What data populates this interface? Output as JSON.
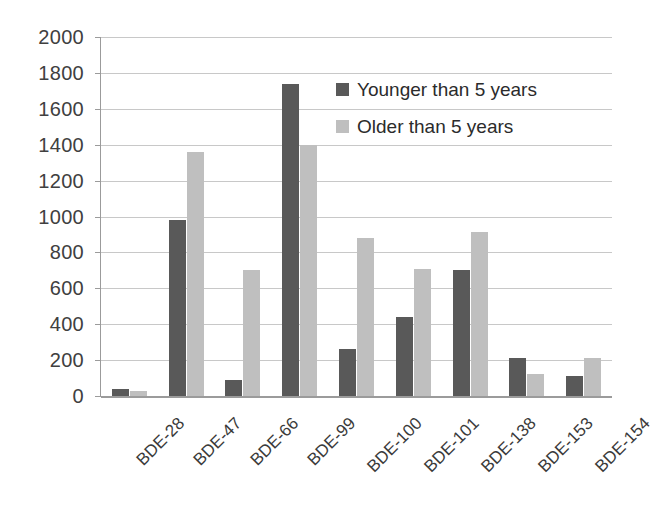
{
  "chart_data": {
    "type": "bar",
    "title": "",
    "subtitle": "",
    "xlabel": "",
    "ylabel": "",
    "ylim": [
      0,
      2000
    ],
    "ytick_step": 200,
    "yticks": [
      "2000",
      "1800",
      "1600",
      "1400",
      "1200",
      "1000",
      "800",
      "600",
      "400",
      "200",
      "0"
    ],
    "grid": true,
    "legend_position": "inside-top-center",
    "categories": [
      "BDE-28",
      "BDE-47",
      "BDE-66",
      "BDE-99",
      "BDE-100",
      "BDE-101",
      "BDE-138",
      "BDE-153",
      "BDE-154"
    ],
    "series": [
      {
        "name": "Younger than 5 years",
        "color": "#595959",
        "values": [
          40,
          980,
          90,
          1740,
          260,
          440,
          700,
          210,
          110
        ]
      },
      {
        "name": "Older than 5 years",
        "color": "#bfbfbf",
        "values": [
          30,
          1360,
          700,
          1400,
          880,
          710,
          915,
          125,
          210
        ]
      }
    ]
  },
  "colors": {
    "series_dark": "#595959",
    "series_light": "#bfbfbf",
    "gridline": "#c8c8c8",
    "axis": "#9b9b9b",
    "text": "#2b2b2b",
    "background": "#ffffff"
  }
}
